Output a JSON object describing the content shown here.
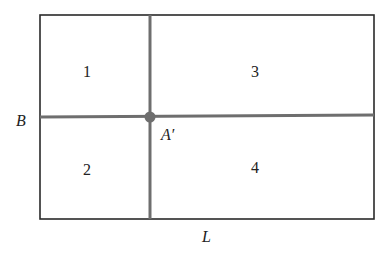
{
  "diagram": {
    "regions": [
      {
        "id": "1",
        "label": "1"
      },
      {
        "id": "2",
        "label": "2"
      },
      {
        "id": "3",
        "label": "3"
      },
      {
        "id": "4",
        "label": "4"
      }
    ],
    "axes": {
      "horizontal_label": "B",
      "vertical_label": "L"
    },
    "point": {
      "label": "A′"
    },
    "colors": {
      "outline": "#2a2a2a",
      "divider": "#6e6e6e",
      "point": "#6e6e6e"
    }
  }
}
